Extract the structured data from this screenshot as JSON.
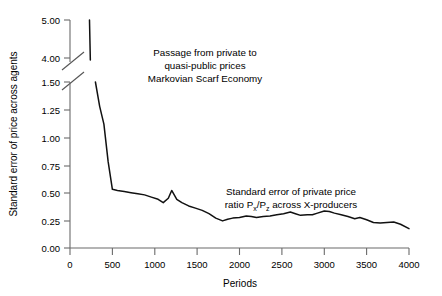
{
  "chart_data": {
    "type": "line",
    "title": "",
    "xlabel": "Periods",
    "ylabel": "Standard error of price across agents",
    "xlim": [
      0,
      4000
    ],
    "xticks": [
      0,
      500,
      1000,
      1500,
      2000,
      2500,
      3000,
      3500,
      4000
    ],
    "xticklabels": [
      "0",
      "500",
      "1000",
      "1500",
      "2000",
      "2500",
      "3000",
      "3500",
      "4000"
    ],
    "grid": false,
    "legend": "none",
    "broken_axis": {
      "present": true,
      "lower_panel_ylim": [
        0.0,
        1.5
      ],
      "lower_panel_yticks": [
        0.0,
        0.25,
        0.5,
        0.75,
        1.0,
        1.25,
        1.5
      ],
      "lower_panel_yticklabels": [
        "0.00",
        "0.25",
        "0.50",
        "0.75",
        "1.00",
        "1.25",
        "1.50"
      ],
      "upper_panel_ylim": [
        4.0,
        5.0
      ],
      "upper_panel_yticks": [
        4.0,
        5.0
      ],
      "upper_panel_yticklabels": [
        "4.00",
        "5.00"
      ]
    },
    "annotations": [
      {
        "name": "passage-annotation",
        "lines": [
          "Passage from private to",
          "quasi-public prices",
          "Markovian Scarf Economy"
        ],
        "x": 1600,
        "y": 1.33
      },
      {
        "name": "private-price-annotation",
        "lines": [
          "Standard error of private price",
          "ratio Px/Pz across X-producers"
        ],
        "x": 2750,
        "y": 0.6
      }
    ],
    "series": [
      {
        "name": "upper-segment",
        "panel": "upper",
        "x": [
          230,
          240
        ],
        "values": [
          5.0,
          3.95
        ]
      },
      {
        "name": "standard-error-of-price",
        "panel": "lower",
        "x": [
          300,
          350,
          400,
          450,
          500,
          560,
          640,
          720,
          800,
          880,
          960,
          1040,
          1100,
          1160,
          1200,
          1260,
          1320,
          1400,
          1480,
          1560,
          1640,
          1720,
          1800,
          1860,
          1920,
          2000,
          2080,
          2140,
          2200,
          2280,
          2360,
          2440,
          2520,
          2600,
          2660,
          2720,
          2800,
          2860,
          2920,
          3000,
          3060,
          3120,
          3200,
          3280,
          3360,
          3420,
          3500,
          3580,
          3660,
          3740,
          3820,
          3900,
          4000
        ],
        "values": [
          1.5,
          1.28,
          1.12,
          0.78,
          0.53,
          0.52,
          0.51,
          0.5,
          0.49,
          0.48,
          0.46,
          0.44,
          0.41,
          0.45,
          0.52,
          0.44,
          0.41,
          0.38,
          0.36,
          0.34,
          0.31,
          0.27,
          0.245,
          0.26,
          0.27,
          0.275,
          0.29,
          0.285,
          0.275,
          0.285,
          0.29,
          0.3,
          0.31,
          0.325,
          0.31,
          0.295,
          0.3,
          0.3,
          0.315,
          0.335,
          0.33,
          0.315,
          0.3,
          0.285,
          0.265,
          0.275,
          0.255,
          0.23,
          0.225,
          0.23,
          0.235,
          0.215,
          0.175
        ]
      }
    ]
  }
}
